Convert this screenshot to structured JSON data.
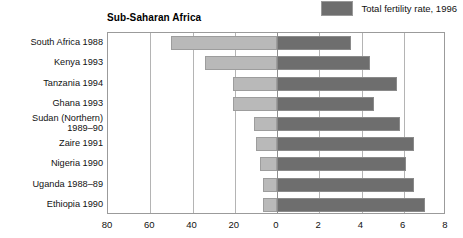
{
  "legend": {
    "swatch_color": "#6e6e6e",
    "label": "Total fertility rate, 1996"
  },
  "chart_title": "Sub-Saharan Africa",
  "chart_data": {
    "type": "bar",
    "orientation": "horizontal-diverging",
    "title": "Sub-Saharan Africa",
    "xlabel": "",
    "ylabel": "",
    "grid": true,
    "legend_position": "top-right",
    "categories": [
      "South Africa 1988",
      "Kenya 1993",
      "Tanzania 1994",
      "Ghana 1993",
      "Sudan (Northern) 1989–90",
      "Zaire 1991",
      "Nigeria 1990",
      "Uganda 1988–89",
      "Ethiopia 1990"
    ],
    "category_lines": [
      [
        "South Africa 1988"
      ],
      [
        "Kenya 1993"
      ],
      [
        "Tanzania 1994"
      ],
      [
        "Ghana 1993"
      ],
      [
        "Sudan (Northern)",
        "1989–90"
      ],
      [
        "Zaire 1991"
      ],
      [
        "Nigeria 1990"
      ],
      [
        "Uganda 1988–89"
      ],
      [
        "Ethiopia 1990"
      ]
    ],
    "series": [
      {
        "name": "left-axis series",
        "axis": "left",
        "color": "#b9b9b9",
        "axis_label": "",
        "xlim": [
          80,
          0
        ],
        "ticks": [
          80,
          60,
          40,
          20,
          0
        ],
        "values": [
          50,
          34,
          21,
          21,
          11,
          10,
          8,
          6.5,
          6.5
        ]
      },
      {
        "name": "Total fertility rate, 1996",
        "axis": "right",
        "color": "#6e6e6e",
        "axis_label": "",
        "xlim": [
          0,
          8
        ],
        "ticks": [
          0,
          2,
          4,
          6,
          8
        ],
        "values": [
          3.5,
          4.4,
          5.7,
          4.6,
          5.8,
          6.5,
          6.1,
          6.5,
          7.0
        ]
      }
    ],
    "left_tick_labels": [
      "80",
      "60",
      "40",
      "20",
      "0"
    ],
    "right_tick_labels": [
      "0",
      "2",
      "4",
      "6",
      "8"
    ]
  }
}
